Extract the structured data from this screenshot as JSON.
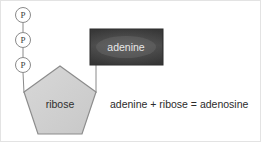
{
  "diagram": {
    "phosphates": [
      {
        "label": "P",
        "cx": 23,
        "cy": 15,
        "r": 7.5
      },
      {
        "label": "P",
        "cx": 23,
        "cy": 40,
        "r": 7.5
      },
      {
        "label": "P",
        "cx": 23,
        "cy": 65,
        "r": 7.5
      }
    ],
    "sugar": {
      "label": "ribose",
      "label_x": 60,
      "label_y": 108,
      "points": "60,66 24,92 38,134 82,134 96,92",
      "fill": "#d2d2d2",
      "stroke": "#808080"
    },
    "base": {
      "label": "adenine",
      "label_x": 126,
      "label_y": 51,
      "x": 90,
      "y": 29,
      "width": 73,
      "height": 36,
      "fill": "#3a3a3a",
      "fill_light": "#585858",
      "stroke": "#2a2a2a"
    },
    "equation": {
      "text": "adenine + ribose = adenosine",
      "x": 110,
      "y": 108
    },
    "connectors": {
      "stroke": "#8a8a8a",
      "phosphate_chain": [
        {
          "x1": 23,
          "y1": 22.5,
          "x2": 23,
          "y2": 32.5
        },
        {
          "x1": 23,
          "y1": 47.5,
          "x2": 23,
          "y2": 57.5
        }
      ],
      "phosphate_to_sugar": {
        "x1": 23,
        "y1": 72.5,
        "x2": 24,
        "y2": 92
      },
      "base_to_sugar": {
        "x1": 96,
        "y1": 65,
        "x2": 96,
        "y2": 92
      }
    }
  }
}
